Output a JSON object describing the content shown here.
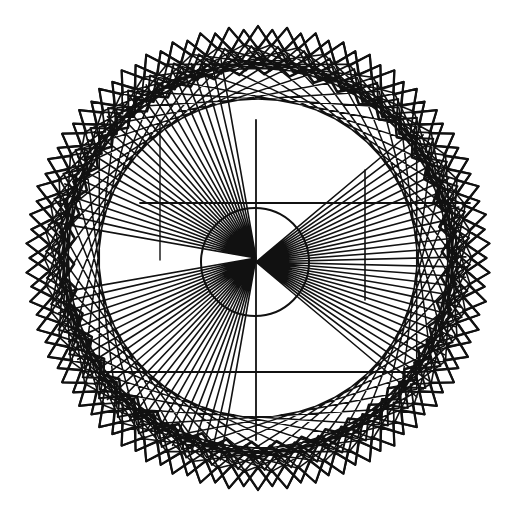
{
  "artwork": {
    "width": 522,
    "height": 523,
    "background": "#ffffff",
    "stroke_color": "#111111",
    "center": [
      258,
      258
    ],
    "outer_star": {
      "points": 50,
      "r_outer": 232,
      "r_inner": 212,
      "rotation_deg": 90,
      "stroke_width": 2.2,
      "repeats": [
        {
          "rot": 0,
          "r_scale": 1.0
        },
        {
          "rot": 3.6,
          "r_scale": 0.985
        }
      ]
    },
    "zigzag_rings": [
      {
        "points": 50,
        "r1": 212,
        "r2": 196,
        "rot": 1.8,
        "stroke_width": 2.0
      },
      {
        "points": 48,
        "r1": 200,
        "r2": 188,
        "rot": 0.0,
        "stroke_width": 2.4
      },
      {
        "points": 46,
        "r1": 194,
        "r2": 184,
        "rot": 2.0,
        "stroke_width": 2.6
      }
    ],
    "chord_polygons": [
      {
        "n": 50,
        "step": 7,
        "r": 214,
        "rot": 0.0,
        "stroke_width": 1.6
      },
      {
        "n": 50,
        "step": 11,
        "r": 206,
        "rot": 3.6,
        "stroke_width": 1.5
      },
      {
        "n": 48,
        "step": 5,
        "r": 200,
        "rot": 1.5,
        "stroke_width": 1.6
      }
    ],
    "fans": [
      {
        "apex": [
          256,
          258
        ],
        "count": 26,
        "from_deg": 190,
        "to_deg": 260,
        "r": 205,
        "stroke_width": 1.6
      },
      {
        "apex": [
          256,
          258
        ],
        "count": 26,
        "from_deg": 100,
        "to_deg": 170,
        "r": 205,
        "stroke_width": 1.6
      },
      {
        "apex": [
          256,
          262
        ],
        "count": 30,
        "from_deg": -40,
        "to_deg": 40,
        "r": 210,
        "stroke_width": 1.6
      }
    ],
    "straight_lines": [
      {
        "x1": 140,
        "y1": 203,
        "x2": 470,
        "y2": 203,
        "w": 1.8
      },
      {
        "x1": 100,
        "y1": 372,
        "x2": 420,
        "y2": 372,
        "w": 1.8
      },
      {
        "x1": 256,
        "y1": 120,
        "x2": 256,
        "y2": 440,
        "w": 1.8
      },
      {
        "x1": 365,
        "y1": 170,
        "x2": 365,
        "y2": 300,
        "w": 1.6
      },
      {
        "x1": 160,
        "y1": 120,
        "x2": 160,
        "y2": 260,
        "w": 1.4
      }
    ],
    "center_disc": {
      "cx": 255,
      "cy": 262,
      "r": 54,
      "fill": "#ffffff"
    },
    "center_disc_edge": {
      "stroke_width": 2.0
    }
  }
}
